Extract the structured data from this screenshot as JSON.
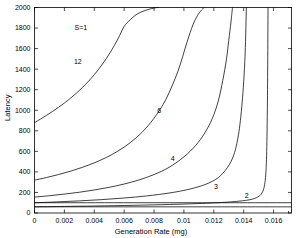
{
  "chart_data": {
    "type": "line",
    "title": "",
    "xlabel": "Generation Rate (mg)",
    "ylabel": "Latency",
    "xlim": [
      0,
      0.0172
    ],
    "ylim": [
      0,
      2000
    ],
    "grid": false,
    "legend": "inline-curve-labels",
    "annotations": [
      {
        "text": "S=1",
        "x": 0.0031,
        "y": 1800
      }
    ],
    "xticks": [
      0,
      0.002,
      0.004,
      0.006,
      0.008,
      0.01,
      0.012,
      0.014,
      0.016
    ],
    "xticklabels": [
      "0",
      "0.002",
      "0.004",
      "0.006",
      "0.008",
      "0.01",
      "0.012",
      "0.014",
      "0.016"
    ],
    "yticks": [
      0,
      200,
      400,
      600,
      800,
      1000,
      1200,
      1400,
      1600,
      1800,
      2000
    ],
    "yticklabels": [
      "0",
      "200",
      "400",
      "600",
      "800",
      "1000",
      "1200",
      "1400",
      "1600",
      "1800",
      "2000"
    ],
    "series": [
      {
        "name": "12",
        "label": "12",
        "label_x": 0.0029,
        "label_y": 1475,
        "asymptote_x": 0.00845,
        "y_at_zero": 880,
        "points_x": [
          0.0,
          0.0004,
          0.0008,
          0.0012,
          0.0016,
          0.002,
          0.0024,
          0.0028,
          0.0032,
          0.0036,
          0.004,
          0.0044,
          0.0048,
          0.0052,
          0.0056,
          0.006,
          0.0064,
          0.0068,
          0.0072,
          0.0076,
          0.008,
          0.0082,
          0.0083
        ],
        "points_y": [
          880,
          914,
          950,
          988,
          1028,
          1070,
          1116,
          1166,
          1220,
          1280,
          1346,
          1420,
          1502,
          1594,
          1698,
          1816,
          1880,
          1930,
          1960,
          1980,
          1995,
          1999,
          2000
        ]
      },
      {
        "name": "6",
        "label": "6",
        "label_x": 0.00835,
        "label_y": 1000,
        "asymptote_x": 0.01155,
        "y_at_zero": 320,
        "points_x": [
          0.0,
          0.0008,
          0.0016,
          0.0024,
          0.0032,
          0.004,
          0.0048,
          0.0056,
          0.0064,
          0.0072,
          0.008,
          0.0088,
          0.0096,
          0.0102,
          0.0106,
          0.0109,
          0.0111,
          0.01125,
          0.01135
        ],
        "points_y": [
          320,
          345,
          374,
          406,
          444,
          488,
          540,
          604,
          684,
          786,
          922,
          1108,
          1380,
          1660,
          1830,
          1920,
          1962,
          1985,
          2000
        ]
      },
      {
        "name": "4",
        "label": "4",
        "label_x": 0.00925,
        "label_y": 530,
        "asymptote_x": 0.01345,
        "y_at_zero": 155,
        "points_x": [
          0.0,
          0.001,
          0.002,
          0.003,
          0.004,
          0.005,
          0.006,
          0.007,
          0.008,
          0.009,
          0.01,
          0.0108,
          0.0114,
          0.0119,
          0.0123,
          0.0126,
          0.01285,
          0.013,
          0.01315,
          0.01325
        ],
        "points_y": [
          155,
          168,
          184,
          202,
          224,
          250,
          282,
          322,
          374,
          444,
          546,
          660,
          780,
          920,
          1090,
          1290,
          1500,
          1680,
          1860,
          2000
        ]
      },
      {
        "name": "3",
        "label": "3",
        "label_x": 0.01215,
        "label_y": 255,
        "asymptote_x": 0.01475,
        "y_at_zero": 100,
        "points_x": [
          0.0,
          0.0015,
          0.003,
          0.0045,
          0.006,
          0.0075,
          0.009,
          0.01,
          0.0108,
          0.0114,
          0.0119,
          0.0123,
          0.0126,
          0.0129,
          0.01315,
          0.01335,
          0.0135,
          0.01365,
          0.01378,
          0.0139,
          0.014,
          0.0141,
          0.01418
        ],
        "points_y": [
          100,
          108,
          118,
          130,
          146,
          166,
          194,
          220,
          248,
          276,
          308,
          344,
          386,
          440,
          500,
          570,
          650,
          760,
          900,
          1080,
          1280,
          1560,
          2000
        ]
      },
      {
        "name": "2",
        "label": "2",
        "label_x": 0.0142,
        "label_y": 170,
        "asymptote_x": 0.016,
        "y_at_zero": 60,
        "points_x": [
          0.0,
          0.002,
          0.004,
          0.006,
          0.008,
          0.01,
          0.0115,
          0.0125,
          0.0132,
          0.0138,
          0.0142,
          0.0145,
          0.01475,
          0.01495,
          0.0151,
          0.01522,
          0.01532,
          0.0154,
          0.01548,
          0.01554,
          0.01559,
          0.01563
        ],
        "points_y": [
          60,
          64,
          68,
          73,
          79,
          87,
          95,
          102,
          109,
          117,
          124,
          132,
          143,
          156,
          172,
          194,
          226,
          276,
          380,
          600,
          1100,
          2000
        ]
      },
      {
        "name": "baseline-flat-a",
        "label": "",
        "label_x": null,
        "label_y": null,
        "asymptote_x": null,
        "y_at_zero": 100,
        "points_x": [
          0.0,
          0.0172
        ],
        "points_y": [
          100,
          100
        ]
      },
      {
        "name": "baseline-flat-b",
        "label": "",
        "label_x": null,
        "label_y": null,
        "asymptote_x": null,
        "y_at_zero": 60,
        "points_x": [
          0.0,
          0.0172
        ],
        "points_y": [
          60,
          60
        ]
      }
    ]
  }
}
